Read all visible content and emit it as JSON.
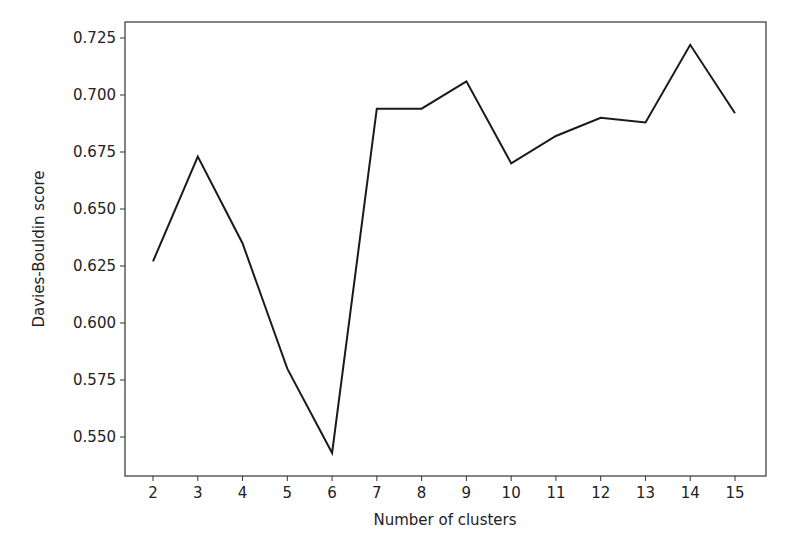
{
  "chart_data": {
    "type": "line",
    "title": "",
    "xlabel": "Number of clusters",
    "ylabel": "Davies-Bouldin score",
    "x": [
      2,
      3,
      4,
      5,
      6,
      7,
      8,
      9,
      10,
      11,
      12,
      13,
      14,
      15
    ],
    "series": [
      {
        "name": "Davies-Bouldin score",
        "color": "#1a1a1a",
        "values": [
          0.627,
          0.673,
          0.635,
          0.58,
          0.543,
          0.694,
          0.694,
          0.706,
          0.67,
          0.682,
          0.69,
          0.688,
          0.722,
          0.692
        ]
      }
    ],
    "x_ticks": [
      "2",
      "3",
      "4",
      "5",
      "6",
      "7",
      "8",
      "9",
      "10",
      "11",
      "12",
      "13",
      "14",
      "15"
    ],
    "y_ticks": [
      "0.550",
      "0.575",
      "0.600",
      "0.625",
      "0.650",
      "0.675",
      "0.700",
      "0.725"
    ],
    "xlim": [
      1.4,
      15.7
    ],
    "ylim": [
      0.5325,
      0.7318
    ],
    "grid": false,
    "legend": "none"
  }
}
